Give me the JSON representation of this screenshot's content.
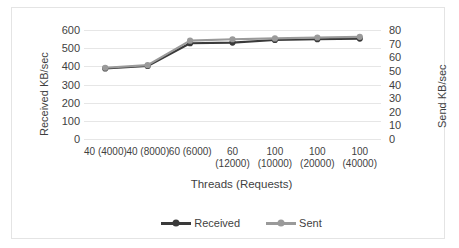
{
  "chart_data": {
    "type": "line",
    "title": "",
    "xlabel": "Threads (Requests)",
    "ylabel": "Received KB/sec",
    "y2label": "Send KB/sec",
    "categories": [
      "40 (4000)",
      "40 (8000)",
      "60 (6000)",
      "60 (12000)",
      "100 (10000)",
      "100 (20000)",
      "100 (40000)"
    ],
    "category_lines": [
      [
        "40 (4000)"
      ],
      [
        "40 (8000)"
      ],
      [
        "60 (6000)"
      ],
      [
        "60",
        "(12000)"
      ],
      [
        "100",
        "(10000)"
      ],
      [
        "100",
        "(20000)"
      ],
      [
        "100",
        "(40000)"
      ]
    ],
    "series": [
      {
        "name": "Received",
        "axis": "left",
        "color": "#3a3a3a",
        "values": [
          388,
          402,
          527,
          531,
          545,
          549,
          553
        ]
      },
      {
        "name": "Sent",
        "axis": "right",
        "color": "#9a9a9a",
        "values": [
          52.3,
          54.2,
          72.2,
          73.2,
          73.8,
          74.5,
          75.0
        ]
      }
    ],
    "ylim": [
      0,
      600
    ],
    "yticks": [
      0,
      100,
      200,
      300,
      400,
      500,
      600
    ],
    "y2lim": [
      0,
      80
    ],
    "y2ticks": [
      0,
      10,
      20,
      30,
      40,
      50,
      60,
      70,
      80
    ],
    "grid": true,
    "legend_position": "bottom"
  },
  "legend": {
    "items": [
      {
        "label": "Received",
        "color": "#3a3a3a"
      },
      {
        "label": "Sent",
        "color": "#9a9a9a"
      }
    ]
  }
}
